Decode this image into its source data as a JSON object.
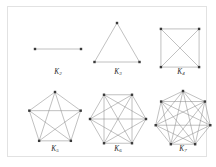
{
  "figure": {
    "background_color": "#ffffff",
    "border_color": "#e2e2e2",
    "edge_color": "#8e8e8e",
    "vertex_color": "#3a3a3a"
  },
  "chart_data": {
    "type": "diagram",
    "xlabel": "",
    "ylabel": "",
    "legend": [],
    "categories": [
      "K2",
      "K3",
      "K4",
      "K5",
      "K6",
      "K7"
    ],
    "values": [
      1,
      3,
      6,
      10,
      15,
      21
    ],
    "series": [
      {
        "name": "vertices",
        "values": [
          2,
          3,
          4,
          5,
          6,
          7
        ]
      },
      {
        "name": "edges",
        "values": [
          1,
          3,
          6,
          10,
          15,
          21
        ]
      }
    ],
    "graphs": [
      {
        "id": "k2",
        "label": "K",
        "subscript": "2",
        "vertices": 2,
        "edges": 1,
        "shape": "segment",
        "radius": 24,
        "rotation_deg": 0,
        "cx": 50,
        "cy": 42,
        "points": [
          [
            27,
            42
          ],
          [
            73,
            42
          ]
        ]
      },
      {
        "id": "k3",
        "label": "K",
        "subscript": "3",
        "vertices": 3,
        "edges": 3,
        "shape": "polygon",
        "radius": 26,
        "rotation_deg": -90,
        "cx": 109,
        "cy": 42
      },
      {
        "id": "k4",
        "label": "K",
        "subscript": "4",
        "vertices": 4,
        "edges": 6,
        "shape": "polygon",
        "radius": 27,
        "rotation_deg": -135,
        "cx": 172,
        "cy": 41
      },
      {
        "id": "k5",
        "label": "K",
        "subscript": "5",
        "vertices": 5,
        "edges": 10,
        "shape": "polygon",
        "radius": 27,
        "rotation_deg": -90,
        "cx": 47,
        "cy": 112
      },
      {
        "id": "k6",
        "label": "K",
        "subscript": "6",
        "vertices": 6,
        "edges": 15,
        "shape": "polygon",
        "radius": 28,
        "rotation_deg": -120,
        "cx": 110,
        "cy": 112
      },
      {
        "id": "k7",
        "label": "K",
        "subscript": "7",
        "vertices": 7,
        "edges": 21,
        "shape": "polygon",
        "radius": 28,
        "rotation_deg": -90,
        "cx": 175,
        "cy": 112
      }
    ]
  }
}
